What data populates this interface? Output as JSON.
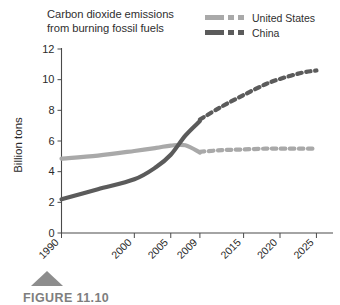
{
  "figure": {
    "caption": "FIGURE 11.10",
    "marker_icon": "triangle-marker"
  },
  "chart_data": {
    "type": "line",
    "title": "Carbon dioxide emissions from burning fossil fuels",
    "title_lines": [
      "Carbon dioxide emissions",
      "from burning fossil fuels"
    ],
    "xlabel": "",
    "ylabel": "Billion tons",
    "ylim": [
      0,
      12
    ],
    "yticks": [
      0,
      2,
      4,
      6,
      8,
      10,
      12
    ],
    "ytick_labels": [
      "0",
      "2",
      "4",
      "6",
      "8",
      "10",
      "12"
    ],
    "xticks": [
      1990,
      2000,
      2005,
      2009,
      2015,
      2020,
      2025
    ],
    "xtick_labels": [
      "1990",
      "2000",
      "2005",
      "2009",
      "2015",
      "2020",
      "2025"
    ],
    "xlim": [
      1990,
      2027
    ],
    "grid": false,
    "legend_position": "top-right",
    "units": "Billion tons",
    "historical_end_year": 2009,
    "series": [
      {
        "name": "United States",
        "color": "#a9a9a9",
        "solid_label": "historical",
        "dashed_label": "projected",
        "x": [
          1990,
          1995,
          2000,
          2003,
          2005,
          2007,
          2009
        ],
        "values": [
          4.85,
          5.05,
          5.35,
          5.55,
          5.7,
          5.72,
          5.25
        ],
        "projected_x": [
          2009,
          2012,
          2015,
          2018,
          2020,
          2023,
          2025
        ],
        "projected_values": [
          5.3,
          5.4,
          5.45,
          5.5,
          5.5,
          5.5,
          5.5
        ]
      },
      {
        "name": "China",
        "color": "#5b5b5b",
        "solid_label": "historical",
        "dashed_label": "projected",
        "x": [
          1990,
          1995,
          2000,
          2003,
          2005,
          2007,
          2009
        ],
        "values": [
          2.2,
          2.85,
          3.5,
          4.3,
          5.1,
          6.35,
          7.3
        ],
        "projected_x": [
          2009,
          2012,
          2015,
          2018,
          2020,
          2023,
          2025
        ],
        "projected_values": [
          7.4,
          8.25,
          9.0,
          9.7,
          10.05,
          10.45,
          10.6
        ]
      }
    ]
  },
  "legend": {
    "entries": [
      {
        "label": "United States",
        "color": "#a9a9a9"
      },
      {
        "label": "China",
        "color": "#5b5b5b"
      }
    ]
  }
}
